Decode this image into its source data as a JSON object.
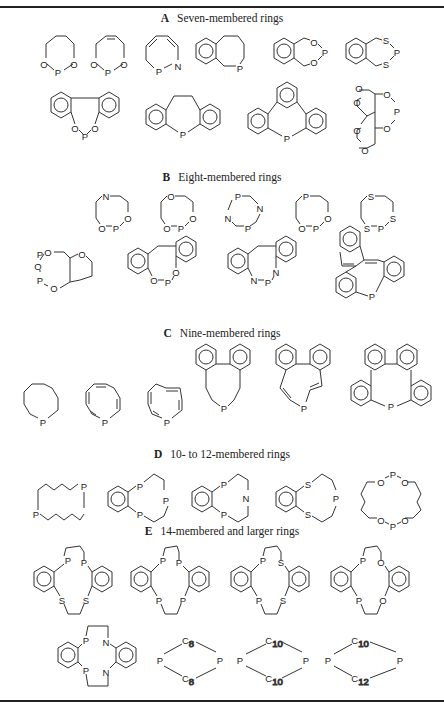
{
  "sections": [
    {
      "letter": "A",
      "title": "Seven-membered rings",
      "structures": [
        {
          "id": "A1",
          "atoms": [
            "O",
            "P",
            "O"
          ],
          "description": "1,3,2-dioxaphosphepane"
        },
        {
          "id": "A2",
          "atoms": [
            "O",
            "P",
            "O"
          ],
          "description": "4,7-dihydro-1,3,2-dioxaphosphepine"
        },
        {
          "id": "A3",
          "atoms": [
            "P",
            "N"
          ],
          "description": "1,2-azaphosphepine"
        },
        {
          "id": "A4",
          "atoms": [
            "P"
          ],
          "description": "benzophosphepine"
        },
        {
          "id": "A5",
          "atoms": [
            "O",
            "P",
            "O"
          ],
          "description": "benzodioxaphosphepine"
        },
        {
          "id": "A6",
          "atoms": [
            "S",
            "P",
            "S"
          ],
          "description": "benzodithiaphosphepine"
        },
        {
          "id": "A7",
          "atoms": [
            "O",
            "P",
            "O"
          ],
          "description": "dibenzodioxaphosphepine"
        },
        {
          "id": "A8",
          "atoms": [
            "P"
          ],
          "description": "dihydrodibenzophosphepine"
        },
        {
          "id": "A9",
          "atoms": [
            "P"
          ],
          "description": "tribenzophosphepine"
        },
        {
          "id": "A10",
          "atoms": [
            "O",
            "O",
            "O",
            "P",
            "O",
            "O",
            "O"
          ],
          "description": "bis(dioxane)-fused dioxaphosphepane"
        }
      ]
    },
    {
      "letter": "B",
      "title": "Eight-membered rings",
      "structures": [
        {
          "id": "B1",
          "atoms": [
            "N",
            "O",
            "P",
            "O"
          ]
        },
        {
          "id": "B2",
          "atoms": [
            "O",
            "O",
            "P",
            "O"
          ]
        },
        {
          "id": "B3",
          "atoms": [
            "P",
            "N",
            "N",
            "P"
          ]
        },
        {
          "id": "B4",
          "atoms": [
            "P",
            "O",
            "P",
            "O"
          ]
        },
        {
          "id": "B5",
          "atoms": [
            "S",
            "S",
            "S",
            "P"
          ]
        },
        {
          "id": "B6",
          "atoms": [
            "P",
            "O",
            "O",
            "P",
            "O",
            "O"
          ]
        },
        {
          "id": "B7",
          "atoms": [
            "O",
            "P",
            "O"
          ]
        },
        {
          "id": "B8",
          "atoms": [
            "N",
            "P",
            "N"
          ]
        },
        {
          "id": "B9",
          "atoms": [
            "P"
          ]
        }
      ]
    },
    {
      "letter": "C",
      "title": "Nine-membered rings",
      "structures": [
        {
          "id": "C1",
          "atoms": [
            "P"
          ]
        },
        {
          "id": "C2",
          "atoms": [
            "P"
          ]
        },
        {
          "id": "C3",
          "atoms": [
            "P"
          ]
        },
        {
          "id": "C4",
          "atoms": [
            "P"
          ]
        },
        {
          "id": "C5",
          "atoms": [
            "P"
          ]
        },
        {
          "id": "C6",
          "atoms": [
            "P"
          ]
        }
      ]
    },
    {
      "letter": "D",
      "title": "10- to 12-membered rings",
      "structures": [
        {
          "id": "D1",
          "atoms": [
            "P",
            "P"
          ]
        },
        {
          "id": "D2",
          "atoms": [
            "P",
            "P"
          ]
        },
        {
          "id": "D3",
          "atoms": [
            "P",
            "N"
          ]
        },
        {
          "id": "D4",
          "atoms": [
            "S",
            "P",
            "S"
          ]
        },
        {
          "id": "D5",
          "atoms": [
            "O",
            "P",
            "O",
            "O",
            "P",
            "O"
          ]
        }
      ]
    },
    {
      "letter": "E",
      "title": "14-membered and larger rings",
      "structures": [
        {
          "id": "E1",
          "atoms": [
            "P",
            "P",
            "S",
            "S"
          ]
        },
        {
          "id": "E2",
          "atoms": [
            "P",
            "P",
            "P",
            "P"
          ]
        },
        {
          "id": "E3",
          "atoms": [
            "P",
            "S",
            "P",
            "S"
          ]
        },
        {
          "id": "E4",
          "atoms": [
            "P",
            "O",
            "P",
            "O"
          ]
        },
        {
          "id": "E5",
          "atoms": [
            "P",
            "N",
            "P",
            "N"
          ]
        },
        {
          "id": "E6",
          "atoms": [
            "P",
            "P"
          ],
          "chains": [
            "C8",
            "C8"
          ]
        },
        {
          "id": "E7",
          "atoms": [
            "P",
            "P"
          ],
          "chains": [
            "C10",
            "C10"
          ]
        },
        {
          "id": "E8",
          "atoms": [
            "P",
            "P"
          ],
          "chains": [
            "C10",
            "C12"
          ]
        }
      ]
    }
  ],
  "labels": {
    "O": "O",
    "P": "P",
    "N": "N",
    "S": "S",
    "C": "C",
    "c8": "8",
    "c10": "10",
    "c12": "12"
  }
}
